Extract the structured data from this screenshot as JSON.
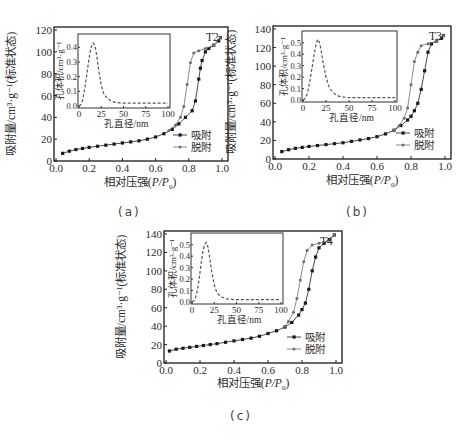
{
  "figure": {
    "captions": [
      "(a)",
      "(b)",
      "(c)"
    ]
  },
  "common": {
    "ylabel": "吸附量/cm³·g⁻¹(标准状态)",
    "xlabel_prefix": "相对压强(",
    "xlabel_var": "P/P",
    "xlabel_sub": "0",
    "xlabel_suffix": ")",
    "inset_xlabel": "孔直径/nm",
    "inset_ylabel": "孔体积/cm³·g⁻¹",
    "legend": [
      "吸附",
      "脱附"
    ],
    "x_ticks": [
      "0.0",
      "0.2",
      "0.4",
      "0.6",
      "0.8",
      "1.0"
    ],
    "inset_x_ticks": [
      "0",
      "25",
      "50",
      "75",
      "100"
    ],
    "colors": {
      "adsorption": "#1a1a1a",
      "desorption": "#6e6e6e",
      "inset": "#555555",
      "frame": "#1a1a1a"
    }
  },
  "chart_data": [
    {
      "type": "line",
      "title": "T2",
      "xlabel": "相对压强(P/P0)",
      "ylabel": "吸附量/cm³·g⁻¹(标准状态)",
      "xlim": [
        0,
        1.0
      ],
      "ylim": [
        0,
        120
      ],
      "y_ticks": [
        "0",
        "20",
        "40",
        "60",
        "80",
        "100",
        "120"
      ],
      "legend_position": "lower right",
      "series": [
        {
          "name": "吸附",
          "marker": "square",
          "x": [
            0.04,
            0.08,
            0.12,
            0.16,
            0.2,
            0.25,
            0.3,
            0.35,
            0.4,
            0.45,
            0.5,
            0.55,
            0.6,
            0.65,
            0.7,
            0.74,
            0.78,
            0.82,
            0.84,
            0.86,
            0.87,
            0.88,
            0.9,
            0.92,
            0.95,
            0.98,
            0.99
          ],
          "y": [
            7,
            9,
            10.5,
            11.5,
            12.5,
            13.5,
            14.5,
            15.5,
            16.5,
            17.5,
            18.5,
            20,
            22,
            25,
            29,
            34,
            40,
            46,
            55,
            75,
            85,
            92,
            100,
            103,
            106,
            110,
            113
          ]
        },
        {
          "name": "脱附",
          "marker": "circle",
          "x": [
            0.99,
            0.95,
            0.9,
            0.86,
            0.83,
            0.81,
            0.79,
            0.77,
            0.75,
            0.72,
            0.68
          ],
          "y": [
            113,
            106,
            103,
            101,
            99,
            90,
            70,
            50,
            40,
            33,
            28
          ]
        }
      ],
      "inset": {
        "xlabel": "孔直径/nm",
        "ylabel": "孔体积/cm³·g⁻¹",
        "xlim": [
          0,
          100
        ],
        "ylim": [
          0,
          0.45
        ],
        "y_ticks": [
          "0.0",
          "0.1",
          "0.2",
          "0.3",
          "0.4"
        ],
        "x": [
          0,
          2,
          4,
          6,
          8,
          10,
          12,
          14,
          16,
          18,
          20,
          22,
          25,
          28,
          32,
          36,
          40,
          50,
          60,
          70,
          80,
          90,
          100
        ],
        "y": [
          0,
          0.01,
          0.04,
          0.1,
          0.18,
          0.27,
          0.35,
          0.41,
          0.43,
          0.41,
          0.34,
          0.25,
          0.14,
          0.08,
          0.05,
          0.035,
          0.025,
          0.02,
          0.02,
          0.02,
          0.02,
          0.02,
          0.02
        ]
      }
    },
    {
      "type": "line",
      "title": "T3",
      "xlabel": "相对压强(P/P0)",
      "ylabel": "吸附量/cm³·g⁻¹(标准状态)",
      "xlim": [
        0,
        1.0
      ],
      "ylim": [
        0,
        140
      ],
      "y_ticks": [
        "0",
        "20",
        "40",
        "60",
        "80",
        "100",
        "120",
        "140"
      ],
      "legend_position": "lower right",
      "series": [
        {
          "name": "吸附",
          "marker": "square",
          "x": [
            0.04,
            0.08,
            0.12,
            0.16,
            0.2,
            0.25,
            0.3,
            0.35,
            0.4,
            0.45,
            0.5,
            0.55,
            0.6,
            0.65,
            0.7,
            0.74,
            0.78,
            0.8,
            0.82,
            0.84,
            0.86,
            0.88,
            0.9,
            0.92,
            0.95,
            0.98,
            0.99
          ],
          "y": [
            8,
            10,
            11.5,
            12.5,
            13.5,
            14.5,
            15.5,
            16.5,
            17.5,
            19,
            20.5,
            22,
            24,
            27,
            31,
            36,
            42,
            46,
            52,
            60,
            75,
            95,
            115,
            124,
            127,
            130,
            133
          ]
        },
        {
          "name": "脱附",
          "marker": "circle",
          "x": [
            0.99,
            0.95,
            0.9,
            0.86,
            0.84,
            0.82,
            0.8,
            0.78,
            0.76,
            0.73,
            0.7
          ],
          "y": [
            133,
            127,
            124,
            122,
            115,
            105,
            80,
            55,
            44,
            36,
            31
          ]
        }
      ],
      "inset": {
        "xlabel": "孔直径/nm",
        "ylabel": "孔体积/cm³·g⁻¹",
        "xlim": [
          0,
          100
        ],
        "ylim": [
          0,
          0.55
        ],
        "y_ticks": [
          "0.0",
          "0.1",
          "0.2",
          "0.3",
          "0.4",
          "0.5"
        ],
        "x": [
          0,
          2,
          4,
          6,
          8,
          10,
          12,
          14,
          16,
          18,
          20,
          22,
          25,
          28,
          32,
          36,
          40,
          50,
          60,
          70,
          80,
          90,
          100
        ],
        "y": [
          0,
          0.01,
          0.04,
          0.1,
          0.19,
          0.29,
          0.39,
          0.48,
          0.53,
          0.5,
          0.42,
          0.32,
          0.2,
          0.12,
          0.07,
          0.045,
          0.03,
          0.02,
          0.02,
          0.02,
          0.02,
          0.02,
          0.02
        ]
      }
    },
    {
      "type": "line",
      "title": "T4",
      "xlabel": "相对压强(P/P0)",
      "ylabel": "吸附量/cm³·g⁻¹(标准状态)",
      "xlim": [
        0,
        1.0
      ],
      "ylim": [
        0,
        145
      ],
      "y_ticks": [
        "0",
        "20",
        "40",
        "60",
        "80",
        "100",
        "120",
        "140"
      ],
      "legend_position": "lower right",
      "series": [
        {
          "name": "吸附",
          "marker": "square",
          "x": [
            0.02,
            0.06,
            0.1,
            0.14,
            0.18,
            0.22,
            0.26,
            0.3,
            0.35,
            0.4,
            0.45,
            0.5,
            0.55,
            0.6,
            0.65,
            0.7,
            0.74,
            0.78,
            0.8,
            0.82,
            0.84,
            0.86,
            0.88,
            0.9,
            0.93,
            0.96,
            0.99
          ],
          "y": [
            13,
            15,
            16,
            17,
            18,
            19,
            20,
            21,
            22.5,
            24,
            25.5,
            27,
            29,
            32,
            35,
            39,
            44,
            52,
            58,
            65,
            80,
            100,
            115,
            125,
            130,
            134,
            139
          ]
        },
        {
          "name": "脱附",
          "marker": "circle",
          "x": [
            0.99,
            0.95,
            0.9,
            0.86,
            0.83,
            0.81,
            0.79,
            0.77,
            0.75,
            0.72,
            0.7
          ],
          "y": [
            139,
            132,
            130,
            128,
            122,
            110,
            90,
            70,
            55,
            45,
            40
          ]
        }
      ],
      "inset": {
        "xlabel": "孔直径/nm",
        "ylabel": "孔体积/cm³·g⁻¹",
        "xlim": [
          0,
          100
        ],
        "ylim": [
          0,
          0.55
        ],
        "y_ticks": [
          "0.0",
          "0.1",
          "0.2",
          "0.3",
          "0.4",
          "0.5"
        ],
        "x": [
          0,
          2,
          4,
          6,
          8,
          10,
          12,
          14,
          16,
          18,
          20,
          22,
          25,
          28,
          32,
          36,
          40,
          50,
          60,
          70,
          80,
          90,
          100
        ],
        "y": [
          0,
          0.01,
          0.04,
          0.1,
          0.2,
          0.32,
          0.43,
          0.5,
          0.52,
          0.48,
          0.38,
          0.27,
          0.15,
          0.08,
          0.05,
          0.035,
          0.025,
          0.02,
          0.02,
          0.02,
          0.02,
          0.02,
          0.02
        ]
      }
    }
  ]
}
